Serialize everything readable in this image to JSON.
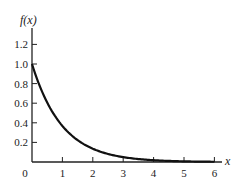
{
  "chart_data": {
    "type": "line",
    "title": "",
    "xlabel": "x",
    "ylabel": "f(x)",
    "xlim": [
      0,
      6
    ],
    "ylim": [
      0,
      1.3
    ],
    "grid": false,
    "legend": null,
    "x_ticks": [
      "0",
      "1",
      "2",
      "3",
      "4",
      "5",
      "6"
    ],
    "y_ticks": [
      "0.2",
      "0.4",
      "0.6",
      "0.8",
      "1.0",
      "1.2"
    ],
    "series": [
      {
        "name": "f(x) = e^{-x}",
        "x": [
          0,
          0.25,
          0.5,
          0.75,
          1,
          1.5,
          2,
          2.5,
          3,
          3.5,
          4,
          4.5,
          5,
          5.5,
          6
        ],
        "values": [
          1.0,
          0.78,
          0.61,
          0.47,
          0.37,
          0.22,
          0.14,
          0.08,
          0.05,
          0.03,
          0.02,
          0.01,
          0.007,
          0.004,
          0.002
        ]
      }
    ],
    "colors": {
      "line": "#111111",
      "axis": "#222222"
    }
  }
}
